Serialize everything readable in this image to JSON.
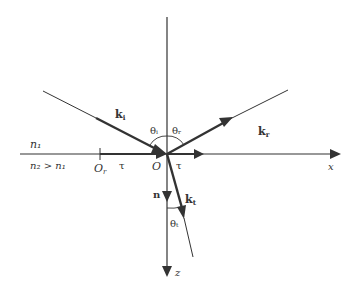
{
  "diagram": {
    "media": {
      "upper": "n₁",
      "lower": "n₂ > n₁"
    },
    "vectors": {
      "incident": {
        "label": "k",
        "subscript": "i"
      },
      "reflected": {
        "label": "k",
        "subscript": "r"
      },
      "transmitted": {
        "label": "k",
        "subscript": "t"
      },
      "normal": {
        "label": "n"
      },
      "tangent_right": {
        "label": "τ"
      },
      "tangent_left": {
        "label": "τ"
      }
    },
    "angles": {
      "incidence": "θᵢ",
      "reflection": "θᵣ",
      "transmission": "θₜ"
    },
    "points": {
      "origin": "O",
      "ref_point": "O",
      "ref_point_sub": "r"
    },
    "axes": {
      "x": "x",
      "z": "z"
    },
    "colors": {
      "line": "#333333",
      "background": "#ffffff"
    }
  }
}
